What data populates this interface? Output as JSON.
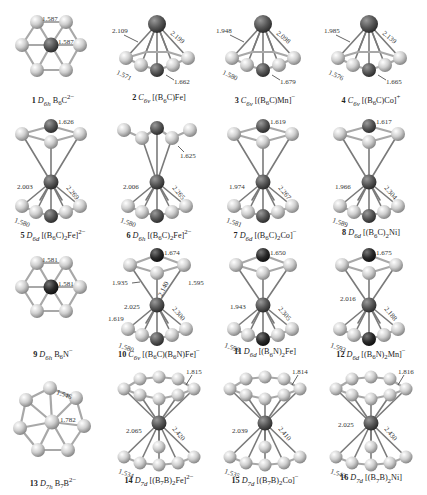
{
  "figure": {
    "structures": [
      {
        "id": 1,
        "num": "1",
        "pg": "D6h",
        "formula": "B6C2−",
        "kind": "planar6",
        "center": "C",
        "labels": {
          "a": "1.587",
          "b": "1.587"
        }
      },
      {
        "id": 2,
        "num": "2",
        "pg": "C6v",
        "formula": "[(B6C)Fe]",
        "kind": "half6",
        "labels": {
          "mx_left": "2.109",
          "mx_right": "2.199",
          "bb": "1.571",
          "bc": "1.662"
        }
      },
      {
        "id": 3,
        "num": "3",
        "pg": "C6v",
        "formula": "[(B6C)Mn]−",
        "kind": "half6",
        "labels": {
          "mx_left": "1.948",
          "mx_right": "2.098",
          "bb": "1.580",
          "bc": "1.679"
        }
      },
      {
        "id": 4,
        "num": "4",
        "pg": "C6v",
        "formula": "[(B6C)Co]+",
        "kind": "half6",
        "labels": {
          "mx_left": "1.985",
          "mx_right": "2.139",
          "bb": "1.576",
          "bc": "1.665"
        }
      },
      {
        "id": 5,
        "num": "5",
        "pg": "D6d",
        "formula": "[(B6C)2Fe]2−",
        "kind": "sandwich6",
        "labels": {
          "top": "1.626",
          "mx_left": "2.003",
          "mx_right": "2.269",
          "bb": "1.580"
        }
      },
      {
        "id": 6,
        "num": "6",
        "pg": "D6h",
        "formula": "[(B6C)2Fe]2−",
        "kind": "sandwich6",
        "labels": {
          "top": "1.625",
          "mx_left": "2.006",
          "mx_right": "2.265",
          "bb": "1.580"
        }
      },
      {
        "id": 7,
        "num": "7",
        "pg": "D6d",
        "formula": "[(B6C)2Co]−",
        "kind": "sandwich6",
        "labels": {
          "top": "1.619",
          "mx_left": "1.974",
          "mx_right": "2.267",
          "bb": "1.581"
        }
      },
      {
        "id": 8,
        "num": "8",
        "pg": "D6d",
        "formula": "[(B6C)2Ni]",
        "kind": "sandwich6",
        "labels": {
          "top": "1.617",
          "mx_left": "1.966",
          "mx_right": "2.304",
          "bb": "1.589"
        }
      },
      {
        "id": 9,
        "num": "9",
        "pg": "D6h",
        "formula": "B6N−",
        "kind": "planar6",
        "center": "N",
        "labels": {
          "a": "1.581",
          "b": "1.581"
        }
      },
      {
        "id": 10,
        "num": "10",
        "pg": "C6v",
        "formula": "[(B6C)(B6N)Fe]−",
        "kind": "sandwich6",
        "labels": {
          "top": "1.674",
          "upper_left": "1.935",
          "upper_mid": "2.140",
          "upper_right": "1.595",
          "mx_left": "2.025",
          "mx_right": "2.300",
          "side": "1.619",
          "bb": "1.580"
        }
      },
      {
        "id": 11,
        "num": "11",
        "pg": "D6d",
        "formula": "[(B6N)2Fe]",
        "kind": "sandwich6",
        "labels": {
          "top": "1.650",
          "mx_left": "1.943",
          "mx_right": "2.305",
          "bb": "1.596"
        }
      },
      {
        "id": 12,
        "num": "12",
        "pg": "D6d",
        "formula": "[(B6N)2Mn]−",
        "kind": "sandwich6",
        "labels": {
          "top": "1.675",
          "mx_left": "2.016",
          "mx_right": "2.188",
          "bb": "1.593"
        }
      },
      {
        "id": 13,
        "num": "13",
        "pg": "D7h",
        "formula": "B7B2−",
        "kind": "planar7",
        "labels": {
          "a": "1.546",
          "b": "1.782"
        }
      },
      {
        "id": 14,
        "num": "14",
        "pg": "D7d",
        "formula": "[(B7B)2Fe]2−",
        "kind": "sandwich7",
        "labels": {
          "top": "1.815",
          "mx_left": "2.065",
          "mx_right": "2.420",
          "bb": "1.534"
        }
      },
      {
        "id": 15,
        "num": "15",
        "pg": "D7d",
        "formula": "[(B7B)2Co]−",
        "kind": "sandwich7",
        "labels": {
          "top": "1.814",
          "mx_left": "2.039",
          "mx_right": "2.410",
          "bb": "1.535"
        }
      },
      {
        "id": 16,
        "num": "16",
        "pg": "D7d",
        "formula": "[(B7B)2Ni]",
        "kind": "sandwich7",
        "labels": {
          "top": "1.816",
          "mx_left": "2.025",
          "mx_right": "2.430",
          "bb": "1.543"
        }
      }
    ],
    "captions": {
      "c1": {
        "num": "1",
        "pg": "D",
        "pgsub": "6h",
        "f": "B",
        "fsub": "6",
        "f2": "C",
        "sup": "2−",
        "f3": ""
      },
      "c2": {
        "num": "2",
        "pg": "C",
        "pgsub": "6v",
        "f": "[(B",
        "fsub": "6",
        "f2": "C)Fe]",
        "sup": "",
        "f3": ""
      },
      "c3": {
        "num": "3",
        "pg": "C",
        "pgsub": "6v",
        "f": "[(B",
        "fsub": "6",
        "f2": "C)Mn]",
        "sup": "−",
        "f3": ""
      },
      "c4": {
        "num": "4",
        "pg": "C",
        "pgsub": "6v",
        "f": "[(B",
        "fsub": "6",
        "f2": "C)Co]",
        "sup": "+",
        "f3": ""
      },
      "c5": {
        "num": "5",
        "pg": "D",
        "pgsub": "6d",
        "f": "[(B",
        "fsub": "6",
        "f2": "C)",
        "sub2": "2",
        "f3": "Fe]",
        "sup": "2−"
      },
      "c6": {
        "num": "6",
        "pg": "D",
        "pgsub": "6h",
        "f": "[(B",
        "fsub": "6",
        "f2": "C)",
        "sub2": "2",
        "f3": "Fe]",
        "sup": "2−"
      },
      "c7": {
        "num": "7",
        "pg": "D",
        "pgsub": "6d",
        "f": "[(B",
        "fsub": "6",
        "f2": "C)",
        "sub2": "2",
        "f3": "Co]",
        "sup": "−"
      },
      "c8": {
        "num": "8",
        "pg": "D",
        "pgsub": "6d",
        "f": "[(B",
        "fsub": "6",
        "f2": "C)",
        "sub2": "2",
        "f3": "Ni]",
        "sup": ""
      },
      "c9": {
        "num": "9",
        "pg": "D",
        "pgsub": "6h",
        "f": "B",
        "fsub": "6",
        "f2": "N",
        "sup": "−",
        "f3": ""
      },
      "c10": {
        "num": "10",
        "pg": "C",
        "pgsub": "6v",
        "f": "[(B",
        "fsub": "6",
        "f2": "C)(B",
        "sub2": "6",
        "f3": "N)Fe]",
        "sup": "−"
      },
      "c11": {
        "num": "11",
        "pg": "D",
        "pgsub": "6d",
        "f": "[(B",
        "fsub": "6",
        "f2": "N)",
        "sub2": "2",
        "f3": "Fe]",
        "sup": ""
      },
      "c12": {
        "num": "12",
        "pg": "D",
        "pgsub": "6d",
        "f": "[(B",
        "fsub": "6",
        "f2": "N)",
        "sub2": "2",
        "f3": "Mn]",
        "sup": "−"
      },
      "c13": {
        "num": "13",
        "pg": "D",
        "pgsub": "7h",
        "f": "B",
        "fsub": "7",
        "f2": "B",
        "sup": "2−",
        "f3": ""
      },
      "c14": {
        "num": "14",
        "pg": "D",
        "pgsub": "7d",
        "f": "[(B",
        "fsub": "7",
        "f2": "B)",
        "sub2": "2",
        "f3": "Fe]",
        "sup": "2−"
      },
      "c15": {
        "num": "15",
        "pg": "D",
        "pgsub": "7d",
        "f": "[(B",
        "fsub": "7",
        "f2": "B)",
        "sub2": "2",
        "f3": "Co]",
        "sup": "−"
      },
      "c16": {
        "num": "16",
        "pg": "D",
        "pgsub": "7d",
        "f": "[(B",
        "fsub": "7",
        "f2": "B)",
        "sub2": "2",
        "f3": "Ni]",
        "sup": ""
      }
    },
    "colors": {
      "boron": "#d4d4d4",
      "center_atom": "#555555",
      "metal": "#5e5e5e",
      "bond": "#a8a8a8",
      "background": "#ffffff"
    }
  }
}
